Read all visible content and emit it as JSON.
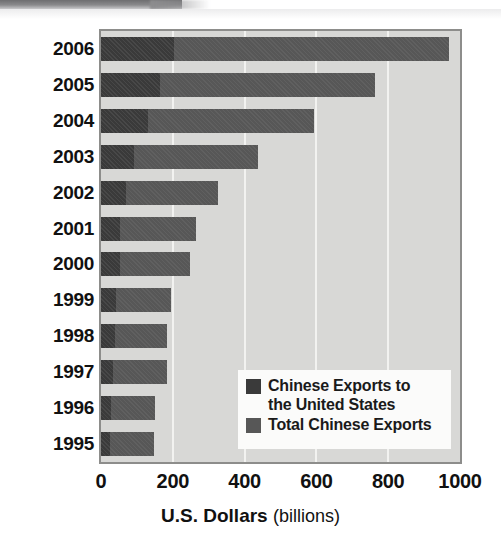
{
  "chart_data": {
    "type": "bar",
    "orientation": "horizontal",
    "stacked": true,
    "title": "",
    "xlabel_strong": "U.S. Dollars",
    "xlabel_weak": "(billions)",
    "ylabel": "",
    "xlim": [
      0,
      1000
    ],
    "xticks": [
      "0",
      "200",
      "400",
      "600",
      "800",
      "1000"
    ],
    "xtick_values": [
      0,
      200,
      400,
      600,
      800,
      1000
    ],
    "grid": "vertical",
    "legend_position": "inside-lower-right",
    "categories": [
      "2006",
      "2005",
      "2004",
      "2003",
      "2002",
      "2001",
      "2000",
      "1999",
      "1998",
      "1997",
      "1996",
      "1995"
    ],
    "series": [
      {
        "name": "Chinese Exports to the United States",
        "color": "#3a3a3a",
        "values": [
          203,
          163,
          130,
          92,
          70,
          54,
          52,
          42,
          38,
          33,
          27,
          24
        ]
      },
      {
        "name": "Total Chinese Exports",
        "color": "#575757",
        "values": [
          969,
          762,
          593,
          438,
          326,
          266,
          249,
          195,
          184,
          183,
          151,
          149
        ]
      }
    ]
  },
  "legend": {
    "entries": [
      {
        "label_line1": "Chinese Exports to",
        "label_line2": "the United States",
        "swatch": "dark-swatch-icon"
      },
      {
        "label_line1": "Total Chinese Exports",
        "label_line2": "",
        "swatch": "mid-swatch-icon"
      }
    ]
  },
  "colors": {
    "plot_background": "#d8d8d6",
    "gridline": "#f2f2f0",
    "frame_border": "#8d8d8b",
    "series_us": "#3a3a3a",
    "series_total": "#575757",
    "legend_background": "#fbfbfa",
    "text": "#111111",
    "page_background": "#ffffff"
  }
}
